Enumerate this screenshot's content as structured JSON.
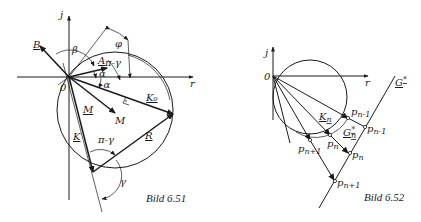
{
  "figure_left": {
    "caption": "Bild 6.51",
    "axes": {
      "imag": "j",
      "real": "r",
      "origin": "0"
    },
    "vectors": {
      "A": "A",
      "B": "B",
      "M": "M",
      "K": "K",
      "K0": "K₀",
      "R": "R"
    },
    "points": {
      "M": "M"
    },
    "angles": {
      "beta": "β",
      "phi": "φ",
      "alpha": "α",
      "neg_alpha": "-α",
      "pi_minus_gamma_top": "π-γ",
      "pi_minus_gamma_bottom": "π-γ",
      "gamma": "γ"
    }
  },
  "figure_right": {
    "caption": "Bild 6.52",
    "axes": {
      "imag": "j",
      "real": "r",
      "origin": "0"
    },
    "vectors": {
      "Kn": "K",
      "Kn_sub": "n",
      "Gn": "G",
      "Gn_sub": "n",
      "Gn_sup": "*",
      "G_line": "G",
      "G_line_sup": "*"
    },
    "points_circle": [
      {
        "base": "p",
        "sub": "n-1"
      },
      {
        "base": "p",
        "sub": "n"
      },
      {
        "base": "p",
        "sub": "n+1"
      }
    ],
    "points_line": [
      {
        "base": "p",
        "sub": "n-1"
      },
      {
        "base": "p",
        "sub": "n"
      },
      {
        "base": "p",
        "sub": "n+1"
      }
    ]
  }
}
